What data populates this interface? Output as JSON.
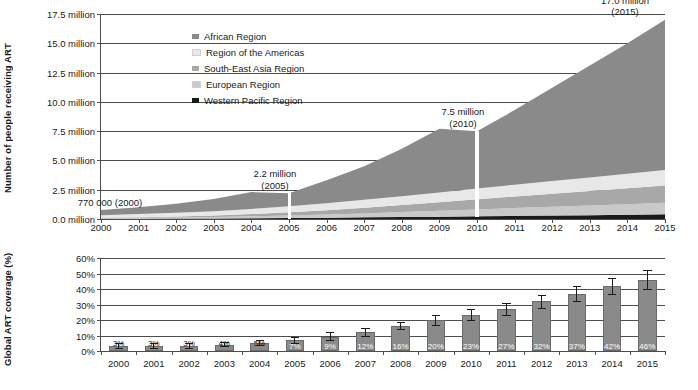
{
  "top": {
    "ylabel": "Number of people receiving ART",
    "yticks": [
      "17.5 million",
      "15.0 million",
      "12.5 million",
      "10.0 million",
      "7.5 million",
      "5.0 million",
      "2.5 million",
      "0.0 million"
    ],
    "ytick_values": [
      17.5,
      15.0,
      12.5,
      10.0,
      7.5,
      5.0,
      2.5,
      0.0
    ],
    "xticks": [
      "2000",
      "2001",
      "2002",
      "2003",
      "2004",
      "2005",
      "2006",
      "2007",
      "2008",
      "2009",
      "2010",
      "2011",
      "2012",
      "2013",
      "2014",
      "2015"
    ],
    "legend": [
      {
        "label": "African Region",
        "color": "#8a8a8a"
      },
      {
        "label": "Region of the Americas",
        "color": "#e8e8e8"
      },
      {
        "label": "South-East Asia Region",
        "color": "#a8a8a8"
      },
      {
        "label": "European Region",
        "color": "#c9c9c9"
      },
      {
        "label": "Western Pacific Region",
        "color": "#1a1a1a"
      }
    ],
    "callouts": [
      {
        "name": "callout-2000",
        "value": "770 000 (2000)",
        "line1": "770 000 (2000)",
        "line2": ""
      },
      {
        "name": "callout-2005",
        "value": "2.2 million",
        "line1": "2.2 million",
        "line2": "(2005)"
      },
      {
        "name": "callout-2010",
        "value": "7.5 million",
        "line1": "7.5 million",
        "line2": "(2010)"
      },
      {
        "name": "callout-2015",
        "value": "17.0 million",
        "line1": "17.0 million",
        "line2": "(2015)"
      }
    ]
  },
  "bottom": {
    "ylabel": "Global ART coverage (%)",
    "yticks": [
      "60%",
      "50%",
      "40%",
      "30%",
      "20%",
      "10%",
      "0%"
    ],
    "ytick_values": [
      60,
      50,
      40,
      30,
      20,
      10,
      0
    ],
    "xticks": [
      "2000",
      "2001",
      "2002",
      "2003",
      "2004",
      "2005",
      "2006",
      "2007",
      "2008",
      "2009",
      "2010",
      "2011",
      "2012",
      "2013",
      "2014",
      "2015"
    ],
    "bar_color": "#8a8a8a"
  },
  "chart_data": [
    {
      "type": "area",
      "title": "",
      "xlabel": "",
      "ylabel": "Number of people receiving ART",
      "ylim": [
        0,
        17.5
      ],
      "grid": true,
      "legend_position": "inside-top-center",
      "x": [
        2000,
        2001,
        2002,
        2003,
        2004,
        2005,
        2006,
        2007,
        2008,
        2009,
        2010,
        2011,
        2012,
        2013,
        2014,
        2015
      ],
      "stack_order_bottom_to_top": [
        "Western Pacific Region",
        "European Region",
        "South-East Asia Region",
        "Region of the Americas",
        "African Region"
      ],
      "series": [
        {
          "name": "Western Pacific Region",
          "color": "#1a1a1a",
          "values": [
            0.02,
            0.03,
            0.04,
            0.05,
            0.07,
            0.09,
            0.11,
            0.14,
            0.17,
            0.2,
            0.24,
            0.27,
            0.3,
            0.33,
            0.36,
            0.4
          ]
        },
        {
          "name": "European Region",
          "color": "#c9c9c9",
          "values": [
            0.05,
            0.07,
            0.09,
            0.12,
            0.16,
            0.21,
            0.27,
            0.34,
            0.42,
            0.5,
            0.58,
            0.66,
            0.74,
            0.82,
            0.9,
            0.98
          ]
        },
        {
          "name": "South-East Asia Region",
          "color": "#a8a8a8",
          "values": [
            0.04,
            0.06,
            0.09,
            0.13,
            0.19,
            0.27,
            0.37,
            0.48,
            0.6,
            0.73,
            0.87,
            1.0,
            1.12,
            1.24,
            1.36,
            1.48
          ]
        },
        {
          "name": "Region of the Americas",
          "color": "#e8e8e8",
          "values": [
            0.21,
            0.26,
            0.31,
            0.37,
            0.44,
            0.52,
            0.6,
            0.68,
            0.76,
            0.84,
            0.92,
            1.0,
            1.08,
            1.16,
            1.24,
            1.32
          ]
        },
        {
          "name": "African Region",
          "color": "#8a8a8a",
          "values": [
            0.45,
            0.58,
            0.77,
            1.03,
            1.44,
            1.11,
            1.95,
            2.86,
            4.05,
            5.43,
            4.89,
            6.37,
            7.96,
            9.55,
            11.14,
            12.82
          ]
        }
      ],
      "annotations": [
        {
          "x": 2000,
          "y": 0.77,
          "text": "770 000 (2000)"
        },
        {
          "x": 2005,
          "y": 2.2,
          "text": "2.2 million (2005)"
        },
        {
          "x": 2010,
          "y": 7.5,
          "text": "7.5 million (2010)"
        },
        {
          "x": 2015,
          "y": 17.0,
          "text": "17.0 million (2015)"
        }
      ],
      "totals": [
        0.77,
        1.0,
        1.3,
        1.7,
        2.3,
        2.2,
        3.3,
        4.5,
        6.0,
        7.7,
        7.5,
        9.3,
        11.2,
        13.1,
        15.0,
        17.0
      ]
    },
    {
      "type": "bar",
      "title": "",
      "xlabel": "",
      "ylabel": "Global ART coverage (%)",
      "ylim": [
        0,
        60
      ],
      "grid": true,
      "categories": [
        "2000",
        "2001",
        "2002",
        "2003",
        "2004",
        "2005",
        "2006",
        "2007",
        "2008",
        "2009",
        "2010",
        "2011",
        "2012",
        "2013",
        "2014",
        "2015"
      ],
      "values": [
        3,
        3,
        3,
        4,
        5,
        7,
        9,
        12,
        16,
        20,
        23,
        27,
        32,
        37,
        42,
        46
      ],
      "data_labels": [
        "3%",
        "3%",
        "3%",
        "4%",
        "5%",
        "7%",
        "9%",
        "12%",
        "16%",
        "20%",
        "23%",
        "27%",
        "32%",
        "37%",
        "42%",
        "46%"
      ],
      "error_low": [
        2,
        2,
        2,
        3,
        4,
        5,
        7,
        10,
        14,
        17,
        20,
        23,
        28,
        32,
        37,
        40
      ],
      "error_high": [
        5,
        5,
        5,
        6,
        7,
        9,
        12,
        15,
        19,
        23,
        27,
        31,
        36,
        42,
        47,
        52
      ]
    }
  ]
}
